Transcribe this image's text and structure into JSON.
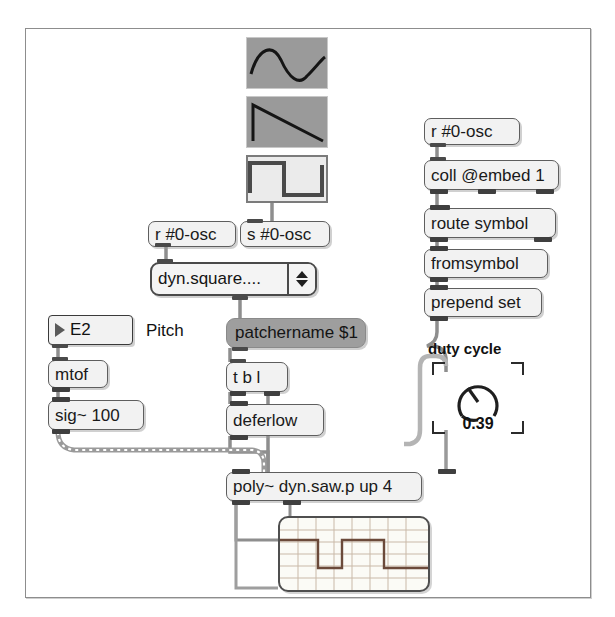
{
  "window": {
    "title": "Max patcher",
    "background_color": "#ffffff",
    "border_color": "#8d8d8d"
  },
  "waveform_thumbnails": [
    {
      "name": "sine",
      "label": "sine-waveform",
      "selected": false,
      "background": "#9a9a9a"
    },
    {
      "name": "sawtooth",
      "label": "sawtooth-waveform",
      "selected": false,
      "background": "#9a9a9a"
    },
    {
      "name": "square",
      "label": "square-waveform",
      "selected": true,
      "background": "#ebebeb"
    }
  ],
  "objects": {
    "receive_osc_left": "r #0-osc",
    "send_osc": "s #0-osc",
    "umenu_value": "dyn.square....",
    "pitch_message": "E2",
    "pitch_comment": "Pitch",
    "mtof": "mtof",
    "sig": "sig~ 100",
    "patchername_message": "patchername $1",
    "trigger": "t b l",
    "deferlow": "deferlow",
    "poly": "poly~ dyn.saw.p up 4",
    "receive_osc_right": "r #0-osc",
    "coll": "coll @embed 1",
    "route_symbol": "route symbol",
    "fromsymbol": "fromsymbol",
    "prepend_set": "prepend set"
  },
  "dial": {
    "label": "duty cycle",
    "value": "0.39",
    "value_number": 0.39,
    "min": 0,
    "max": 1
  },
  "scope": {
    "name": "scope-display",
    "waveform": "pulse",
    "grid": true
  },
  "colors": {
    "object_fill": "#f2f2f2",
    "object_border": "#5e5e5e",
    "message_grey": "#9e9e9e",
    "cable_grey": "#8e8e8e",
    "text": "#111111"
  }
}
